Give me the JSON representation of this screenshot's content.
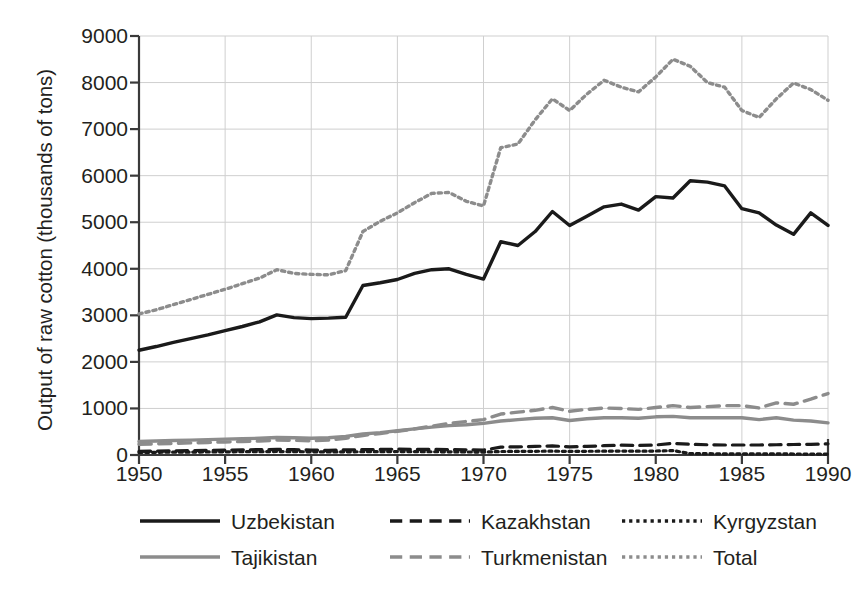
{
  "chart_data": {
    "type": "line",
    "title": "",
    "xlabel": "",
    "ylabel": "Output of raw cotton (thousands of tons)",
    "xlim": [
      1950,
      1990
    ],
    "ylim": [
      0,
      9000
    ],
    "xticks": [
      1950,
      1955,
      1960,
      1965,
      1970,
      1975,
      1980,
      1985,
      1990
    ],
    "yticks": [
      0,
      1000,
      2000,
      3000,
      4000,
      5000,
      6000,
      7000,
      8000,
      9000
    ],
    "grid": true,
    "legend_position": "bottom",
    "x": [
      1950,
      1951,
      1952,
      1953,
      1954,
      1955,
      1956,
      1957,
      1958,
      1959,
      1960,
      1961,
      1962,
      1963,
      1964,
      1965,
      1966,
      1967,
      1968,
      1969,
      1970,
      1971,
      1972,
      1973,
      1974,
      1975,
      1976,
      1977,
      1978,
      1979,
      1980,
      1981,
      1982,
      1983,
      1984,
      1985,
      1986,
      1987,
      1988,
      1989,
      1990
    ],
    "series": [
      {
        "name": "Uzbekistan",
        "style": "solid",
        "color": "#1a1a1a",
        "width": 3.4,
        "values": [
          2250,
          2330,
          2420,
          2500,
          2580,
          2670,
          2760,
          2860,
          3010,
          2950,
          2930,
          2940,
          2960,
          3640,
          3700,
          3770,
          3900,
          3980,
          4000,
          3880,
          3780,
          4580,
          4500,
          4800,
          5230,
          4930,
          5130,
          5330,
          5390,
          5260,
          5550,
          5520,
          5890,
          5860,
          5780,
          5290,
          5200,
          4940,
          4740,
          5200,
          4930
        ]
      },
      {
        "name": "Kazakhstan",
        "style": "dashed",
        "color": "#1a1a1a",
        "width": 3.2,
        "values": [
          80,
          85,
          90,
          95,
          100,
          105,
          110,
          115,
          120,
          115,
          105,
          100,
          110,
          115,
          120,
          125,
          120,
          120,
          115,
          110,
          105,
          170,
          175,
          185,
          195,
          175,
          185,
          200,
          210,
          205,
          215,
          250,
          230,
          220,
          215,
          215,
          215,
          220,
          225,
          230,
          240
        ]
      },
      {
        "name": "Kyrgyzstan",
        "style": "dotted",
        "color": "#1a1a1a",
        "width": 3.2,
        "values": [
          55,
          58,
          60,
          62,
          65,
          68,
          70,
          72,
          75,
          72,
          68,
          65,
          68,
          70,
          72,
          75,
          72,
          70,
          68,
          65,
          62,
          75,
          78,
          80,
          82,
          78,
          80,
          82,
          85,
          82,
          85,
          95,
          30,
          28,
          26,
          25,
          24,
          23,
          22,
          20,
          18
        ]
      },
      {
        "name": "Tajikistan",
        "style": "solid",
        "color": "#8c8c8c",
        "width": 3.4,
        "values": [
          290,
          300,
          310,
          320,
          330,
          340,
          350,
          360,
          375,
          370,
          360,
          370,
          400,
          450,
          480,
          520,
          560,
          600,
          630,
          650,
          680,
          730,
          760,
          790,
          800,
          740,
          780,
          800,
          800,
          790,
          820,
          830,
          800,
          800,
          800,
          800,
          760,
          800,
          750,
          730,
          690
        ]
      },
      {
        "name": "Turkmenistan",
        "style": "dashed",
        "color": "#8c8c8c",
        "width": 3.4,
        "values": [
          230,
          240,
          250,
          260,
          270,
          280,
          290,
          300,
          320,
          315,
          305,
          320,
          360,
          420,
          460,
          510,
          560,
          620,
          680,
          720,
          760,
          880,
          920,
          960,
          1020,
          940,
          980,
          1010,
          1000,
          980,
          1020,
          1060,
          1020,
          1040,
          1060,
          1060,
          1010,
          1120,
          1090,
          1200,
          1320
        ]
      },
      {
        "name": "Total",
        "style": "dotted",
        "color": "#8c8c8c",
        "width": 3.4,
        "values": [
          3030,
          3120,
          3230,
          3340,
          3450,
          3560,
          3680,
          3800,
          3980,
          3900,
          3880,
          3870,
          3960,
          4800,
          5020,
          5200,
          5420,
          5620,
          5640,
          5450,
          5350,
          6600,
          6680,
          7200,
          7650,
          7400,
          7750,
          8050,
          7900,
          7800,
          8120,
          8500,
          8350,
          8000,
          7900,
          7400,
          7250,
          7650,
          7990,
          7850,
          7620
        ]
      }
    ]
  },
  "axis": {
    "ylabel": "Output of raw cotton (thousands of tons)",
    "ytick_labels": [
      "0",
      "1000",
      "2000",
      "3000",
      "4000",
      "5000",
      "6000",
      "7000",
      "8000",
      "9000"
    ],
    "xtick_labels": [
      "1950",
      "1955",
      "1960",
      "1965",
      "1970",
      "1975",
      "1980",
      "1985",
      "1990"
    ]
  },
  "legend": {
    "rows": [
      [
        {
          "label": "Uzbekistan",
          "style": "solid",
          "color": "#1a1a1a"
        },
        {
          "label": "Kazakhstan",
          "style": "dashed",
          "color": "#1a1a1a"
        },
        {
          "label": "Kyrgyzstan",
          "style": "dotted",
          "color": "#1a1a1a"
        }
      ],
      [
        {
          "label": "Tajikistan",
          "style": "solid",
          "color": "#8c8c8c"
        },
        {
          "label": "Turkmenistan",
          "style": "dashed",
          "color": "#8c8c8c"
        },
        {
          "label": "Total",
          "style": "dotted",
          "color": "#8c8c8c"
        }
      ]
    ]
  },
  "colors": {
    "axis": "#3a3a3a",
    "grid": "#cfcfcf",
    "text": "#231f20",
    "dark_series": "#1a1a1a",
    "light_series": "#8c8c8c"
  }
}
